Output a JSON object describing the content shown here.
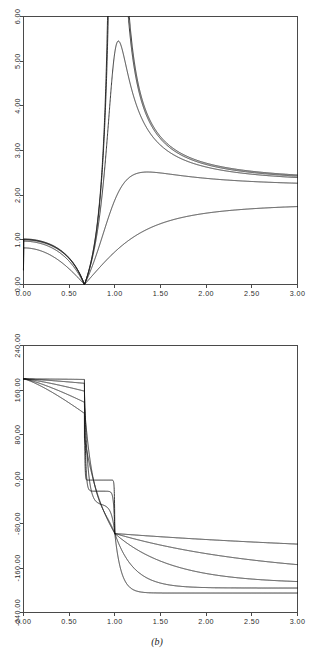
{
  "figure": {
    "caption": "(b)",
    "panels": 2,
    "background": "#ffffff",
    "line_color": "#181818",
    "axis_color": "#4a4a4a"
  },
  "chart_data": [
    {
      "type": "line",
      "panel": "a-magnitude",
      "title": "",
      "xlabel": "",
      "ylabel": "",
      "xlim": [
        0.0,
        3.0
      ],
      "ylim": [
        0.0,
        6.0
      ],
      "grid": false,
      "legend": "none",
      "xticks": [
        0.0,
        0.5,
        1.0,
        1.5,
        2.0,
        2.5,
        3.0
      ],
      "xticklabels": [
        "0.00",
        "0.50",
        "1.00",
        "1.50",
        "2.00",
        "2.50",
        "3.00"
      ],
      "yticks": [
        0.0,
        1.0,
        2.0,
        3.0,
        4.0,
        5.0,
        6.0
      ],
      "yticklabels": [
        "0.00",
        "1.00",
        "2.00",
        "3.00",
        "4.00",
        "5.00",
        "6.00"
      ],
      "notch_x": 0.667,
      "resonance_x": 1.0,
      "series": [
        {
          "name": "q1",
          "damping": 0.01,
          "peak": 9.8,
          "peak_x": 1.0,
          "end_value": 1.02
        },
        {
          "name": "q2",
          "damping": 0.04,
          "peak": 2.58,
          "peak_x": 1.01,
          "end_value": 1.01
        },
        {
          "name": "q3",
          "damping": 0.12,
          "peak": 1.42,
          "peak_x": 1.09,
          "end_value": 1.0
        },
        {
          "name": "q4",
          "damping": 0.32,
          "peak": 0.99,
          "peak_x": 1.8,
          "end_value": 0.97
        },
        {
          "name": "q5",
          "damping": 0.7,
          "peak": 0.82,
          "peak_x": 3.0,
          "end_value": 0.82
        }
      ],
      "start_value": 0.33
    },
    {
      "type": "line",
      "panel": "b-phase",
      "title": "",
      "xlabel": "",
      "ylabel": "",
      "xlim": [
        0.0,
        3.0
      ],
      "ylim": [
        -240.0,
        240.0
      ],
      "grid": false,
      "legend": "none",
      "xticks": [
        0.0,
        0.5,
        1.0,
        1.5,
        2.0,
        2.5,
        3.0
      ],
      "xticklabels": [
        "0.00",
        "0.50",
        "1.00",
        "1.50",
        "2.00",
        "2.50",
        "3.00"
      ],
      "yticks": [
        -240.0,
        -160.0,
        -80.0,
        0.0,
        80.0,
        160.0,
        240.0
      ],
      "yticklabels": [
        "-240.00",
        "-160.00",
        "-80.00",
        "0.00",
        "80.00",
        "160.00",
        "240.00"
      ],
      "notch_x": 0.667,
      "resonance_x": 1.0,
      "start_value": 180.0,
      "crossing_value": -98.0,
      "series": [
        {
          "name": "q1",
          "damping": 0.01,
          "pre_notch_end": 179.0,
          "mid_plateau": -2.0,
          "end_value": -205.0
        },
        {
          "name": "q2",
          "damping": 0.04,
          "pre_notch_end": 172.0,
          "mid_plateau": -22.0,
          "end_value": -196.0
        },
        {
          "name": "q3",
          "damping": 0.12,
          "pre_notch_end": 158.0,
          "mid_plateau": -46.0,
          "end_value": -188.0
        },
        {
          "name": "q4",
          "damping": 0.32,
          "pre_notch_end": 138.0,
          "mid_plateau": -64.0,
          "end_value": -178.0
        },
        {
          "name": "q5",
          "damping": 0.7,
          "pre_notch_end": 118.0,
          "mid_plateau": -78.0,
          "end_value": -143.0
        }
      ]
    }
  ]
}
